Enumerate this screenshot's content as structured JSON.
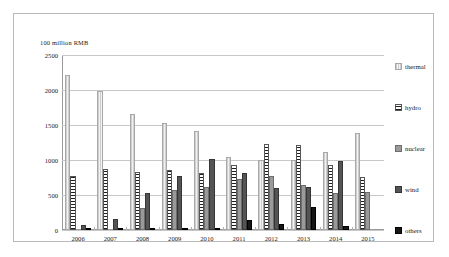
{
  "chart_data": {
    "type": "bar",
    "title": "",
    "subtitle": "",
    "unit_label": "100 million  RMB",
    "xlabel": "",
    "ylabel": "",
    "ylim": [
      0,
      2500
    ],
    "ytick_values": [
      0,
      500,
      1000,
      1500,
      2000,
      2500
    ],
    "ytick_labels": [
      "0",
      "500",
      "1000",
      "1500",
      "2000",
      "2500"
    ],
    "grid": true,
    "grid_axis": "y",
    "legend_position": "right",
    "categories": [
      "2006",
      "2007",
      "2008",
      "2009",
      "2010",
      "2011",
      "2012",
      "2013",
      "2014",
      "2015"
    ],
    "series": [
      {
        "name": "thermal",
        "pattern": "vertical-hatch-light",
        "color": "#e3e3e3",
        "values": [
          2210,
          1990,
          1660,
          1525,
          1410,
          1040,
          1000,
          1000,
          1120,
          1380
        ]
      },
      {
        "name": "hydro",
        "pattern": "horizontal-hatch-dark",
        "color": "#1f1f1f",
        "values": [
          765,
          865,
          835,
          860,
          820,
          930,
          1225,
          1220,
          935,
          760
        ]
      },
      {
        "name": "nuclear",
        "pattern": "solid-mid-grey",
        "color": "#9a9a9a",
        "values": [
          0,
          0,
          310,
          570,
          620,
          725,
          770,
          640,
          530,
          550
        ]
      },
      {
        "name": "wind",
        "pattern": "solid-dark-grey",
        "color": "#545454",
        "values": [
          75,
          160,
          525,
          775,
          1020,
          815,
          595,
          615,
          990,
          0
        ]
      },
      {
        "name": "others",
        "pattern": "solid-black",
        "color": "#161616",
        "values": [
          20,
          15,
          10,
          15,
          30,
          140,
          90,
          330,
          60,
          0
        ]
      }
    ]
  },
  "legend": {
    "items": [
      {
        "label": "thermal"
      },
      {
        "label": "hydro"
      },
      {
        "label": "nuclear"
      },
      {
        "label": "wind"
      },
      {
        "label": "others"
      }
    ]
  }
}
